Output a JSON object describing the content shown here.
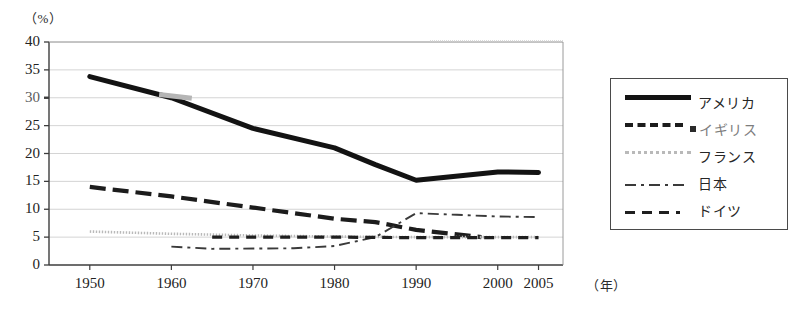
{
  "chart_data": {
    "type": "line",
    "title": "",
    "xlabel": "年",
    "ylabel": "%",
    "y_unit_label": "（%）",
    "x_unit_label": "（年）",
    "xlim": [
      1945,
      2008
    ],
    "ylim": [
      0,
      40
    ],
    "yticks": [
      0,
      5,
      10,
      15,
      20,
      25,
      30,
      35,
      40
    ],
    "ytick_labels": [
      "0",
      "5",
      "10",
      "15",
      "20",
      "25",
      "30",
      "35",
      "40"
    ],
    "xticks": [
      1950,
      1960,
      1970,
      1980,
      1990,
      2000,
      2005
    ],
    "xtick_labels": [
      "1950",
      "1960",
      "1970",
      "1980",
      "1990",
      "2000",
      "2005"
    ],
    "grid": true,
    "legend_position": "right-outside",
    "series": [
      {
        "name": "アメリカ",
        "style": "solid-thick",
        "color": "#131313",
        "x": [
          1950,
          1960,
          1970,
          1980,
          1985,
          1990,
          2000,
          2005
        ],
        "values": [
          33.8,
          30.0,
          24.5,
          21.0,
          18.0,
          15.2,
          16.7,
          16.6
        ]
      },
      {
        "name": "イギリス",
        "style": "dashed-thick",
        "color": "#1c1c1c",
        "x": [
          1950,
          1960,
          1970,
          1980,
          1985,
          1990,
          1998
        ],
        "values": [
          14.0,
          12.3,
          10.3,
          8.3,
          7.7,
          6.3,
          5.0
        ]
      },
      {
        "name": "フランス",
        "style": "dotted-light",
        "color": "#b9b9b9",
        "x": [
          1950,
          1960,
          1970,
          1980,
          1990,
          2000,
          2005
        ],
        "values": [
          6.0,
          5.6,
          5.3,
          5.1,
          5.0,
          5.0,
          5.0
        ]
      },
      {
        "name": "日本",
        "style": "dash-dot",
        "color": "#3a3a3a",
        "x": [
          1960,
          1965,
          1975,
          1980,
          1985,
          1990,
          1995,
          2000,
          2005
        ],
        "values": [
          3.3,
          2.9,
          3.0,
          3.4,
          5.0,
          9.3,
          9.0,
          8.7,
          8.6
        ]
      },
      {
        "name": "ドイツ",
        "style": "dashed-medium",
        "color": "#1f1f1f",
        "x": [
          1965,
          1970,
          1980,
          1990,
          2000,
          2005
        ],
        "values": [
          5.0,
          5.0,
          5.0,
          4.9,
          4.9,
          4.9
        ]
      }
    ]
  },
  "legend": {
    "items": [
      {
        "label": "アメリカ",
        "swatch": "solid-thick-swatch"
      },
      {
        "label": "イギリス",
        "swatch": "dashed-thick-swatch"
      },
      {
        "label": "フランス",
        "swatch": "dotted-light-swatch"
      },
      {
        "label": "日本",
        "swatch": "dash-dot-swatch"
      },
      {
        "label": "ドイツ",
        "swatch": "dashed-medium-swatch"
      }
    ]
  }
}
